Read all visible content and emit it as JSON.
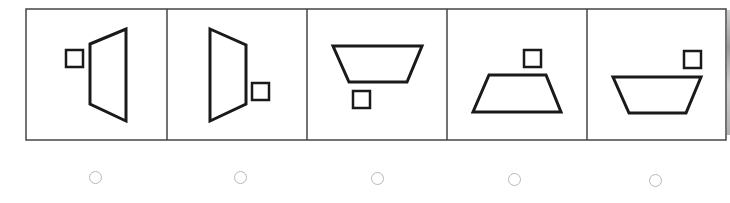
{
  "puzzle": {
    "frame": {
      "x": 26,
      "y": 9,
      "width": 700,
      "height": 131,
      "stroke": "#444444"
    },
    "dividers_x": [
      167,
      307,
      447,
      587
    ],
    "shape_stroke": "#1a1a1a",
    "options": [
      {
        "index": 1,
        "label": "option-1",
        "square": {
          "x": 66,
          "y": 50,
          "size": 17
        },
        "trapezoid": "90,44 126,29 126,121 90,104",
        "radio": {
          "cx": 95,
          "cy": 177
        }
      },
      {
        "index": 2,
        "label": "option-2",
        "square": {
          "x": 252,
          "y": 83,
          "size": 17
        },
        "trapezoid": "210,29 246,45 246,104 210,121",
        "radio": {
          "cx": 240,
          "cy": 177
        }
      },
      {
        "index": 3,
        "label": "option-3",
        "square": {
          "x": 353,
          "y": 91,
          "size": 17
        },
        "trapezoid": "333,46 422,46 407,82 349,82",
        "radio": {
          "cx": 377,
          "cy": 178
        }
      },
      {
        "index": 4,
        "label": "option-4",
        "square": {
          "x": 524,
          "y": 50,
          "size": 17
        },
        "trapezoid": "489,75 546,75 561,112 473,112",
        "radio": {
          "cx": 514,
          "cy": 179
        }
      },
      {
        "index": 5,
        "label": "option-5",
        "square": {
          "x": 684,
          "y": 51,
          "size": 17
        },
        "trapezoid": "613,77 701,77 686,113 629,113",
        "radio": {
          "cx": 655,
          "cy": 180
        }
      }
    ],
    "radio_color": "#b8b8b8"
  }
}
